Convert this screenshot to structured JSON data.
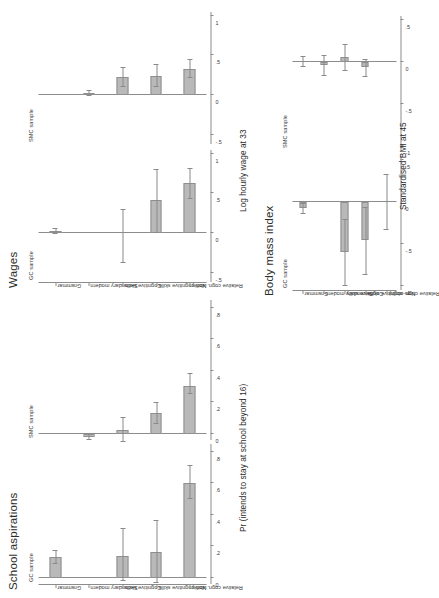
{
  "figure": {
    "background": "#ffffff",
    "bar_fill": "#b9b9b9",
    "bar_stroke": "#8f8f8f",
    "axis_color": "#8c8c8c"
  },
  "categories": [
    "Grammar",
    "Secondary modern",
    "Cognitive skills",
    "Non-cognitive skills",
    "Relative cogn. ability"
  ],
  "sample_labels": {
    "gc": "GC sample",
    "smc": "SMC sample"
  },
  "panels": {
    "school": {
      "title": "School aspirations",
      "axis_title": "Pr (intends to stay at school beyond 16)",
      "ticks": [
        "0",
        ".2",
        ".4",
        ".6",
        ".8"
      ],
      "tick_values": [
        0,
        0.2,
        0.4,
        0.6,
        0.8
      ],
      "ylim": [
        -0.04,
        0.85
      ]
    },
    "wages": {
      "title": "Wages",
      "axis_title": "Log hourly wage at 33",
      "ticks": [
        "-.5",
        "0",
        ".5",
        "1"
      ],
      "tick_values": [
        -0.5,
        0,
        0.5,
        1
      ],
      "ylim": [
        -0.62,
        1.05
      ]
    },
    "bmi": {
      "title": "Body mass index",
      "axis_title": "Standardised BMI at 45",
      "ticks": [
        "-1",
        "-.5",
        "0",
        ".5"
      ],
      "tick_values": [
        -1,
        -0.5,
        0,
        0.5
      ],
      "ylim": [
        -1.05,
        0.55
      ]
    }
  },
  "chart_data": {
    "type": "bar",
    "categories": [
      "Grammar",
      "Secondary modern",
      "Cognitive skills",
      "Non-cognitive skills",
      "Relative cogn. ability"
    ],
    "error_bars": "95% confidence intervals",
    "legend_position": "none",
    "grid": false,
    "panels": [
      {
        "panel": "School aspirations",
        "sample": "GC sample",
        "ylabel": "Pr (intends to stay at school beyond 16)",
        "ylim": [
          0,
          0.8
        ],
        "yticks": [
          0,
          0.2,
          0.4,
          0.6,
          0.8
        ],
        "series": [
          {
            "category": "Grammar",
            "value": 0.13,
            "ci_low": 0.09,
            "ci_high": 0.175
          },
          {
            "category": "Secondary modern",
            "value": 0.0,
            "ci_low": 0.0,
            "ci_high": 0.0
          },
          {
            "category": "Cognitive skills",
            "value": 0.14,
            "ci_low": -0.02,
            "ci_high": 0.31
          },
          {
            "category": "Non-cognitive skills",
            "value": 0.165,
            "ci_low": -0.03,
            "ci_high": 0.36
          },
          {
            "category": "Relative cogn. ability",
            "value": 0.605,
            "ci_low": 0.5,
            "ci_high": 0.715
          }
        ]
      },
      {
        "panel": "School aspirations",
        "sample": "SMC sample",
        "ylabel": "Pr (intends to stay at school beyond 16)",
        "ylim": [
          0,
          0.8
        ],
        "yticks": [
          0,
          0.2,
          0.4,
          0.6,
          0.8
        ],
        "series": [
          {
            "category": "Grammar",
            "value": 0.0,
            "ci_low": 0.0,
            "ci_high": 0.0
          },
          {
            "category": "Secondary modern",
            "value": -0.02,
            "ci_low": -0.04,
            "ci_high": 0.0
          },
          {
            "category": "Cognitive skills",
            "value": 0.025,
            "ci_low": -0.05,
            "ci_high": 0.1
          },
          {
            "category": "Non-cognitive skills",
            "value": 0.13,
            "ci_low": 0.065,
            "ci_high": 0.195
          },
          {
            "category": "Relative cogn. ability",
            "value": 0.305,
            "ci_low": 0.255,
            "ci_high": 0.38
          }
        ]
      },
      {
        "panel": "Wages",
        "sample": "GC sample",
        "ylabel": "Log hourly wage at 33",
        "ylim": [
          -0.5,
          1.0
        ],
        "yticks": [
          -0.5,
          0,
          0.5,
          1
        ],
        "series": [
          {
            "category": "Grammar",
            "value": 0.02,
            "ci_low": -0.01,
            "ci_high": 0.055
          },
          {
            "category": "Secondary modern",
            "value": 0.0,
            "ci_low": 0.0,
            "ci_high": 0.0
          },
          {
            "category": "Cognitive skills",
            "value": 0.0,
            "ci_low": -0.38,
            "ci_high": 0.3
          },
          {
            "category": "Non-cognitive skills",
            "value": 0.42,
            "ci_low": 0.0,
            "ci_high": 0.8
          },
          {
            "category": "Relative cogn. ability",
            "value": 0.63,
            "ci_low": 0.44,
            "ci_high": 0.82
          }
        ]
      },
      {
        "panel": "Wages",
        "sample": "SMC sample",
        "ylabel": "Log hourly wage at 33",
        "ylim": [
          -0.5,
          1.0
        ],
        "yticks": [
          -0.5,
          0,
          0.5,
          1
        ],
        "series": [
          {
            "category": "Grammar",
            "value": 0.0,
            "ci_low": 0.0,
            "ci_high": 0.0
          },
          {
            "category": "Secondary modern",
            "value": 0.02,
            "ci_low": -0.01,
            "ci_high": 0.05
          },
          {
            "category": "Cognitive skills",
            "value": 0.225,
            "ci_low": 0.1,
            "ci_high": 0.35
          },
          {
            "category": "Non-cognitive skills",
            "value": 0.245,
            "ci_low": 0.11,
            "ci_high": 0.39
          },
          {
            "category": "Relative cogn. ability",
            "value": 0.335,
            "ci_low": 0.22,
            "ci_high": 0.45
          }
        ]
      },
      {
        "panel": "Body mass index",
        "sample": "GC sample",
        "ylabel": "Standardised BMI at 45",
        "ylim": [
          -1.0,
          0.5
        ],
        "yticks": [
          -1,
          -0.5,
          0,
          0.5
        ],
        "series": [
          {
            "category": "Grammar",
            "value": -0.075,
            "ci_low": -0.135,
            "ci_high": -0.02
          },
          {
            "category": "Secondary modern",
            "value": 0.0,
            "ci_low": 0.0,
            "ci_high": 0.0
          },
          {
            "category": "Cognitive skills",
            "value": -0.6,
            "ci_low": -1.0,
            "ci_high": -0.21
          },
          {
            "category": "Non-cognitive skills",
            "value": -0.45,
            "ci_low": -0.87,
            "ci_high": -0.07
          },
          {
            "category": "Relative cogn. ability",
            "value": 0.0,
            "ci_low": -0.33,
            "ci_high": 0.33
          }
        ]
      },
      {
        "panel": "Body mass index",
        "sample": "SMC sample",
        "ylabel": "Standardised BMI at 45",
        "ylim": [
          -1.0,
          0.5
        ],
        "yticks": [
          -1,
          -0.5,
          0,
          0.5
        ],
        "series": [
          {
            "category": "Grammar",
            "value": 0.0,
            "ci_low": -0.05,
            "ci_high": 0.06
          },
          {
            "category": "Secondary modern",
            "value": -0.04,
            "ci_low": -0.16,
            "ci_high": 0.08
          },
          {
            "category": "Cognitive skills",
            "value": 0.06,
            "ci_low": -0.1,
            "ci_high": 0.21
          },
          {
            "category": "Non-cognitive skills",
            "value": -0.06,
            "ci_low": -0.17,
            "ci_high": 0.03
          },
          {
            "category": "Relative cogn. ability",
            "value": 0.0,
            "ci_low": 0.0,
            "ci_high": 0.0
          }
        ]
      }
    ]
  }
}
